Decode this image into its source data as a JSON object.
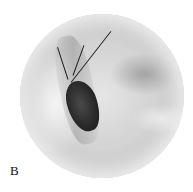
{
  "figure": {
    "panel_label": "B",
    "colors": {
      "background": "#ffffff",
      "tissue": "#d2d2d2",
      "opening": "#2a2a2a"
    }
  }
}
